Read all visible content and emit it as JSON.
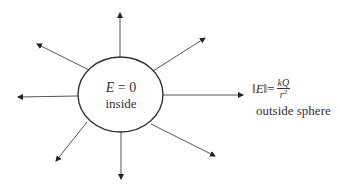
{
  "diagram": {
    "type": "electric-field-of-charged-sphere",
    "sphere": {
      "cx": 120.5,
      "cy": 94.5,
      "rx": 42.5,
      "ry": 37.5,
      "stroke": "#333333"
    },
    "arrows": [
      {
        "name": "up",
        "x1": 120,
        "y1": 57,
        "x2": 120,
        "y2": 13
      },
      {
        "name": "upper-left",
        "x1": 89,
        "y1": 70,
        "x2": 37,
        "y2": 44
      },
      {
        "name": "left",
        "x1": 78,
        "y1": 96,
        "x2": 18,
        "y2": 97
      },
      {
        "name": "lower-left",
        "x1": 87,
        "y1": 122,
        "x2": 56,
        "y2": 161
      },
      {
        "name": "down",
        "x1": 121,
        "y1": 132,
        "x2": 121,
        "y2": 179
      },
      {
        "name": "lower-right",
        "x1": 151,
        "y1": 124,
        "x2": 215,
        "y2": 156
      },
      {
        "name": "right",
        "x1": 163,
        "y1": 95,
        "x2": 243,
        "y2": 95
      },
      {
        "name": "upper-right",
        "x1": 153,
        "y1": 71,
        "x2": 205,
        "y2": 38
      }
    ],
    "inside_label": {
      "symbol": "E",
      "equals": " = 0",
      "word": "inside"
    },
    "outside_label": {
      "lhs": "‖E‖",
      "norm_left": "‖",
      "symbol": "E",
      "norm_right": "‖",
      "equals": "=",
      "numerator": "kQ",
      "denominator": "r",
      "exponent": "2",
      "word": "outside sphere"
    },
    "line_color": "#555555"
  }
}
